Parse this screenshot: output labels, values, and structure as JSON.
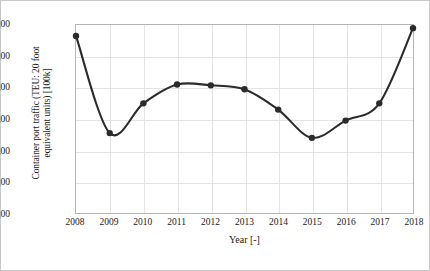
{
  "chart_data": {
    "type": "line",
    "title": "",
    "xlabel": "Year [-]",
    "ylabel": "Container port traffic (TEU: 20 foot equivalent units) [100k]",
    "ylabel_line1": "Container port traffic (TEU: 20 foot",
    "ylabel_line2": "equivalent units) [100k]",
    "categories": [
      "2008",
      "2009",
      "2010",
      "2011",
      "2012",
      "2013",
      "2014",
      "2015",
      "2016",
      "2017",
      "2018"
    ],
    "values": [
      11.3,
      5.1,
      7.0,
      8.2,
      8.15,
      7.9,
      6.6,
      4.8,
      5.9,
      7.0,
      11.8
    ],
    "ylim": [
      0.0,
      12.0
    ],
    "yticks": [
      "0,00",
      "2,00",
      "4,00",
      "6,00",
      "8,00",
      "10,00",
      "12,00"
    ],
    "ytick_values": [
      0,
      2,
      4,
      6,
      8,
      10,
      12
    ],
    "xticks": [
      "2008",
      "2009",
      "2010",
      "2011",
      "2012",
      "2013",
      "2014",
      "2015",
      "2016",
      "2017",
      "2018"
    ],
    "grid": true,
    "legend": "none",
    "series_color": "#2b2b2b",
    "grid_color": "#e4e4e4",
    "marker": "circle",
    "decimal_separator": ","
  }
}
